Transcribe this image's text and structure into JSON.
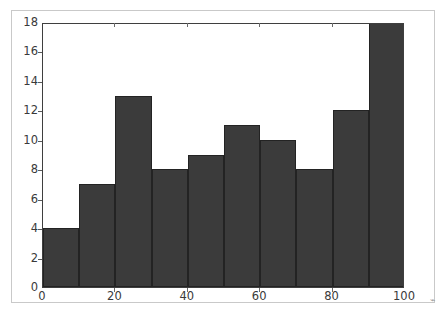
{
  "figure": {
    "background_color": "#ffffff",
    "frame_color": "#c9c9c9",
    "axis_color": "#3f3f3f"
  },
  "chart_data": {
    "type": "bar",
    "title": "",
    "subtitle": "",
    "xlabel": "",
    "ylabel": "",
    "categories": [
      "0-10",
      "10-20",
      "20-30",
      "30-40",
      "40-50",
      "50-60",
      "60-70",
      "70-80",
      "80-90",
      "90-100"
    ],
    "bin_edges": [
      0,
      10,
      20,
      30,
      40,
      50,
      60,
      70,
      80,
      90,
      100
    ],
    "values": [
      4,
      7,
      13,
      8,
      9,
      11,
      10,
      8,
      12,
      18
    ],
    "bar_color": "#3b3b3b",
    "bar_edge_color": "#232323",
    "xlim": [
      0,
      100
    ],
    "ylim": [
      0,
      18
    ],
    "xticks": [
      0,
      20,
      40,
      60,
      80,
      100
    ],
    "xtick_labels": [
      "0",
      "20",
      "40",
      "60",
      "80",
      "100"
    ],
    "yticks": [
      0,
      2,
      4,
      6,
      8,
      10,
      12,
      14,
      16,
      18
    ],
    "ytick_labels": [
      "0",
      "2",
      "4",
      "6",
      "8",
      "10",
      "12",
      "14",
      "16",
      "18"
    ],
    "grid": false,
    "legend": null,
    "legend_position": "none",
    "annotations": []
  },
  "artifact": {
    "glyph": "⌁"
  }
}
